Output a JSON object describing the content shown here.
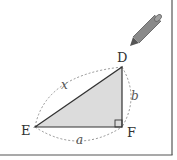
{
  "diagram": {
    "type": "right-triangle",
    "vertices": {
      "D": {
        "label": "D",
        "x": 122,
        "y": 67
      },
      "E": {
        "label": "E",
        "x": 35,
        "y": 127
      },
      "F": {
        "label": "F",
        "x": 122,
        "y": 127
      }
    },
    "right_angle_at": "F",
    "sides": {
      "hypotenuse": {
        "label": "x",
        "from": "E",
        "to": "D"
      },
      "vertical": {
        "label": "b",
        "from": "F",
        "to": "D"
      },
      "horizontal": {
        "label": "a",
        "from": "E",
        "to": "F"
      }
    },
    "icons": {
      "pencil": "pencil-icon"
    },
    "colors": {
      "triangle_fill": "#dcdcdc",
      "triangle_stroke": "#333333",
      "dashed_arc": "#888888",
      "frame": "#555555",
      "pencil": "#808080"
    }
  }
}
